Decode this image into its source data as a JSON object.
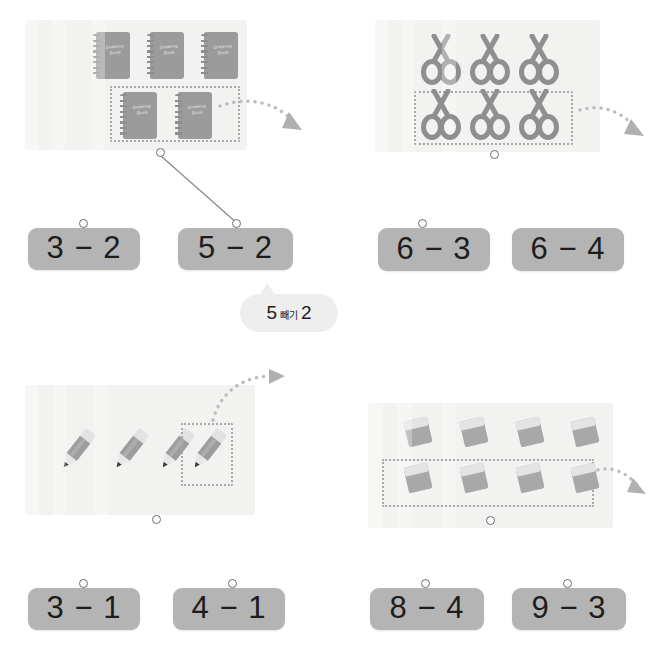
{
  "worksheet": {
    "title": "Subtraction matching worksheet",
    "language": "ko"
  },
  "colors": {
    "panel_bg": "#f2f2f0",
    "card_bg": "#b4b4b4",
    "item_gray": "#9b9b9b",
    "dash_gray": "#a8a8a8",
    "bubble_bg": "#eeeeee",
    "text_dark": "#1d1d1d"
  },
  "problems": [
    {
      "id": "problem-1",
      "item_name": "drawing-book",
      "item_label": "Drawing Book",
      "total": 5,
      "top_row": 3,
      "selected": 2,
      "answer": "5 − 2",
      "cards": [
        {
          "label": "3 − 2",
          "has_connector": true,
          "connected": false
        },
        {
          "label": "5 − 2",
          "has_connector": true,
          "connected": true
        }
      ]
    },
    {
      "id": "problem-2",
      "item_name": "scissors",
      "item_label": "Scissors",
      "total": 6,
      "top_row": 3,
      "selected": 3,
      "answer": "6 − 3",
      "cards": [
        {
          "label": "6 − 3",
          "has_connector": true,
          "connected": false
        },
        {
          "label": "6 − 4",
          "has_connector": false,
          "connected": false
        }
      ]
    },
    {
      "id": "problem-3",
      "item_name": "pencil",
      "item_label": "Pencil",
      "total": 4,
      "top_row": 4,
      "selected": 1,
      "answer": "4 − 1",
      "cards": [
        {
          "label": "3 − 1",
          "has_connector": true,
          "connected": false
        },
        {
          "label": "4 − 1",
          "has_connector": true,
          "connected": false
        }
      ]
    },
    {
      "id": "problem-4",
      "item_name": "eraser",
      "item_label": "Eraser",
      "total": 8,
      "top_row": 4,
      "selected": 4,
      "answer": "8 − 4",
      "cards": [
        {
          "label": "8 − 4",
          "has_connector": true,
          "connected": false
        },
        {
          "label": "9 − 3",
          "has_connector": true,
          "connected": false
        }
      ]
    }
  ],
  "speech_bubble": {
    "first_number": "5",
    "operator_word": "빼기",
    "second_number": "2",
    "full_text": "5 빼기 2"
  }
}
